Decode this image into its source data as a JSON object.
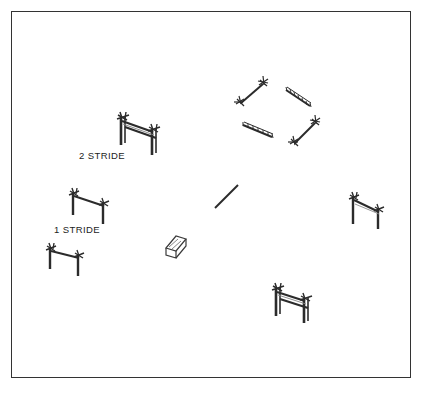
{
  "diagram": {
    "background_color": "#ffffff",
    "border_color": "#333333",
    "line_color": "#2b2b2b",
    "arena": {
      "x": 11,
      "y": 11,
      "width": 400,
      "height": 367
    },
    "labels": [
      {
        "id": "two-stride",
        "text": "2 STRIDE",
        "x": 79,
        "y": 150
      },
      {
        "id": "one-stride",
        "text": "1 STRIDE",
        "x": 54,
        "y": 224
      }
    ],
    "obstacles": [
      {
        "id": "oxer-upper-left",
        "name": "double-rail-oxer",
        "type": "oxer",
        "rails": 2,
        "standards": 2,
        "label": "2 STRIDE",
        "x": 112,
        "y": 113
      },
      {
        "id": "vertical-left-upper",
        "name": "single-rail-vertical",
        "type": "vertical",
        "rails": 1,
        "standards": 2,
        "label": "1 STRIDE",
        "x": 64,
        "y": 188
      },
      {
        "id": "vertical-left-lower",
        "name": "single-rail-vertical",
        "type": "vertical",
        "rails": 1,
        "standards": 2,
        "label": "",
        "x": 42,
        "y": 243
      },
      {
        "id": "vertical-right",
        "name": "single-rail-vertical",
        "type": "vertical",
        "rails": 1,
        "standards": 2,
        "label": "",
        "x": 344,
        "y": 192
      },
      {
        "id": "oxer-bottom",
        "name": "double-rail-oxer",
        "type": "oxer",
        "rails": 2,
        "standards": 2,
        "label": "",
        "x": 268,
        "y": 284
      },
      {
        "id": "cavaletti-top-left",
        "name": "cavaletti-pole",
        "type": "cavaletti",
        "x": 236,
        "y": 80
      },
      {
        "id": "grid-pole-top-right",
        "name": "ridged-ground-pole",
        "type": "ridged-pole",
        "x": 286,
        "y": 86
      },
      {
        "id": "grid-pole-bottom-left",
        "name": "ridged-ground-pole",
        "type": "ridged-pole",
        "x": 243,
        "y": 119
      },
      {
        "id": "cavaletti-bottom-right",
        "name": "cavaletti-pole",
        "type": "cavaletti",
        "x": 291,
        "y": 116
      },
      {
        "id": "ground-pole-center",
        "name": "plain-ground-pole",
        "type": "ground-pole",
        "x": 215,
        "y": 184
      },
      {
        "id": "block-center",
        "name": "filler-block",
        "type": "block",
        "x": 165,
        "y": 236
      }
    ]
  }
}
